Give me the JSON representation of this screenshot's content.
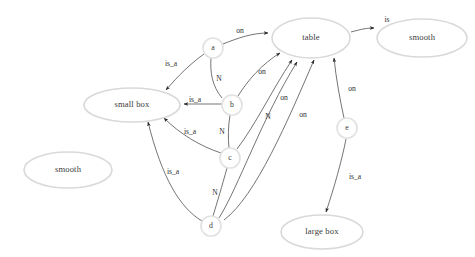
{
  "diagram": {
    "background_color": "#ffffff",
    "node_fill": "#ffffff",
    "node_stroke": "#d9d9d9",
    "edge_color": "#5b5b5b",
    "label_color": "#2e2e2e",
    "ellipse_nodes": [
      {
        "id": "table",
        "label": "table",
        "cx": 311,
        "cy": 38,
        "rx": 39,
        "ry": 20
      },
      {
        "id": "smooth_r",
        "label": "smooth",
        "cx": 422,
        "cy": 38,
        "rx": 45,
        "ry": 19
      },
      {
        "id": "small_box",
        "label": "small box",
        "cx": 132,
        "cy": 105,
        "rx": 48,
        "ry": 17
      },
      {
        "id": "smooth_l",
        "label": "smooth",
        "cx": 68,
        "cy": 170,
        "rx": 44,
        "ry": 18
      },
      {
        "id": "large_box",
        "label": "large box",
        "cx": 322,
        "cy": 232,
        "rx": 41,
        "ry": 17
      }
    ],
    "circle_nodes": [
      {
        "id": "a",
        "label": "a",
        "cx": 213,
        "cy": 48,
        "r": 10
      },
      {
        "id": "b",
        "label": "b",
        "cx": 232,
        "cy": 105,
        "r": 10
      },
      {
        "id": "c",
        "label": "c",
        "cx": 230,
        "cy": 158,
        "r": 10
      },
      {
        "id": "d",
        "label": "d",
        "cx": 211,
        "cy": 226,
        "r": 10
      },
      {
        "id": "e",
        "label": "e",
        "cx": 347,
        "cy": 128,
        "r": 10
      }
    ],
    "edges": [
      {
        "id": "a-on-table",
        "from": "a",
        "to": "table",
        "label": "on",
        "lx": 240,
        "ly": 31
      },
      {
        "id": "table-is-smooth",
        "from": "table",
        "to": "smooth_r",
        "label": "is",
        "lx": 387,
        "ly": 20
      },
      {
        "id": "a-isa-smallbox",
        "from": "a",
        "to": "small_box",
        "label": "is_a",
        "lx": 171,
        "ly": 64
      },
      {
        "id": "a-N-b",
        "from": "a",
        "to": "b",
        "label": "N",
        "lx": 219,
        "ly": 79
      },
      {
        "id": "b-isa-smallbox",
        "from": "b",
        "to": "small_box",
        "label": "is_a",
        "lx": 195,
        "ly": 100
      },
      {
        "id": "b-on-table",
        "from": "b",
        "to": "table",
        "label": "on",
        "lx": 262,
        "ly": 72
      },
      {
        "id": "b-N-c",
        "from": "b",
        "to": "c",
        "label": "N",
        "lx": 222,
        "ly": 132
      },
      {
        "id": "c-isa-smallbox",
        "from": "c",
        "to": "small_box",
        "label": "is_a",
        "lx": 190,
        "ly": 132
      },
      {
        "id": "c-on-table",
        "from": "c",
        "to": "table",
        "label": "on",
        "lx": 284,
        "ly": 98
      },
      {
        "id": "c-N-d",
        "from": "c",
        "to": "d",
        "label": "N",
        "lx": 215,
        "ly": 193
      },
      {
        "id": "d-isa-smallbox",
        "from": "d",
        "to": "small_box",
        "label": "is_a",
        "lx": 173,
        "ly": 172
      },
      {
        "id": "d-N-table",
        "from": "d",
        "to": "table",
        "label": "N",
        "lx": 268,
        "ly": 117
      },
      {
        "id": "d-on-table",
        "from": "d",
        "to": "table",
        "label": "on",
        "lx": 303,
        "ly": 115
      },
      {
        "id": "e-on-table",
        "from": "e",
        "to": "table",
        "label": "on",
        "lx": 352,
        "ly": 89
      },
      {
        "id": "e-isa-largebox",
        "from": "e",
        "to": "large_box",
        "label": "is_a",
        "lx": 355,
        "ly": 177
      }
    ]
  }
}
